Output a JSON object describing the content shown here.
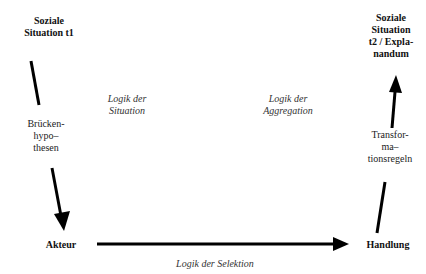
{
  "nodes": {
    "situation_t1": "Soziale Situation t1",
    "situation_t1_lines": [
      "Soziale",
      "Situation t1"
    ],
    "situation_t2_lines": [
      "Soziale",
      "Situation",
      "t2 / Expla-",
      "nandum"
    ],
    "actor": "Akteur",
    "action": "Handlung"
  },
  "edge_labels": {
    "bridge_hypotheses_lines": [
      "Brücken-",
      "hypo–",
      "thesen"
    ],
    "transformation_rules_lines": [
      "Transfor-",
      "ma–",
      "tionsregeln"
    ],
    "logic_situation_lines": [
      "Logik der",
      "Situation"
    ],
    "logic_aggregation_lines": [
      "Logik der",
      "Aggregation"
    ],
    "logic_selection": "Logik der Selektion"
  },
  "colors": {
    "arrow": "#000000",
    "background": "#ffffff"
  }
}
